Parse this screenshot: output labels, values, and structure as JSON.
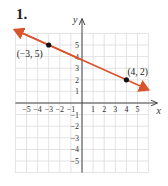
{
  "problem_number": "1.",
  "chart_data": {
    "type": "line",
    "title": "",
    "xlabel": "x",
    "ylabel": "y",
    "xlim": [
      -6,
      6
    ],
    "ylim": [
      -6,
      6
    ],
    "grid": true,
    "x_ticks": [
      "−5",
      "−4",
      "−3",
      "−2",
      "−1",
      "1",
      "2",
      "3",
      "4",
      "5"
    ],
    "y_ticks": [
      "5",
      "4",
      "3",
      "2",
      "1",
      "−1",
      "−2",
      "−3",
      "−4",
      "−5"
    ],
    "series": [
      {
        "name": "line",
        "color": "#d9532b",
        "arrows": "both",
        "x": [
          -3,
          4
        ],
        "y": [
          5,
          2
        ]
      }
    ],
    "points": [
      {
        "label": "(−3, 5)",
        "x": -3,
        "y": 5
      },
      {
        "label": "(4, 2)",
        "x": 4,
        "y": 2
      }
    ]
  }
}
